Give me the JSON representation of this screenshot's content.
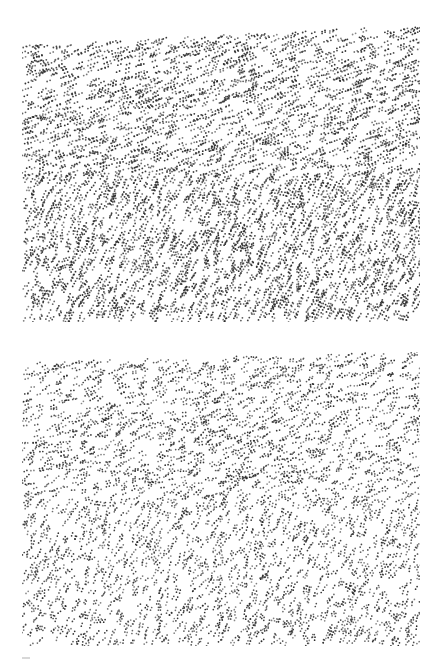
{
  "figure": {
    "background": "#ffffff",
    "dot_color": "#2a2a2a",
    "panels": [
      {
        "name": "top-panel",
        "x": 22,
        "y": 26,
        "width": 398,
        "height": 296,
        "seed": 7,
        "style": "coherent",
        "regions": [
          {
            "y0": 0,
            "y1": 150,
            "angle_deg": -22,
            "density": 0.55,
            "skew_top": 10
          },
          {
            "y0": 150,
            "y1": 296,
            "angle_deg": -62,
            "density": 0.62,
            "skew_top": 0
          }
        ],
        "dipole_gap": 3.2,
        "dot_radius": 0.9
      },
      {
        "name": "bottom-panel",
        "x": 22,
        "y": 352,
        "width": 398,
        "height": 294,
        "seed": 21,
        "style": "jittered",
        "regions": [
          {
            "y0": 0,
            "y1": 150,
            "angle_deg": -25,
            "density": 0.45,
            "skew_top": 6
          },
          {
            "y0": 150,
            "y1": 294,
            "angle_deg": -60,
            "density": 0.42,
            "skew_top": 0
          }
        ],
        "dipole_gap": 3.0,
        "dot_radius": 0.85
      }
    ]
  }
}
